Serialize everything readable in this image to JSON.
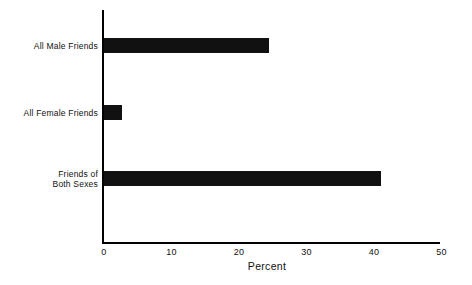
{
  "chart_data": {
    "type": "bar",
    "orientation": "horizontal",
    "title": "",
    "xlabel": "Percent",
    "ylabel": "",
    "categories": [
      "All Male Friends",
      "All Female Friends",
      "Friends of\nBoth Sexes"
    ],
    "values": [
      24.4,
      2.7,
      41.0
    ],
    "xlim": [
      0,
      50
    ],
    "xticks": [
      0,
      10,
      20,
      30,
      40,
      50
    ],
    "xtick_labels": [
      "0",
      "10",
      "20",
      "30",
      "40",
      "50"
    ],
    "grid": false,
    "legend": false,
    "bar_color": "#111111",
    "axis_color": "#000000",
    "background_color": "#ffffff"
  }
}
